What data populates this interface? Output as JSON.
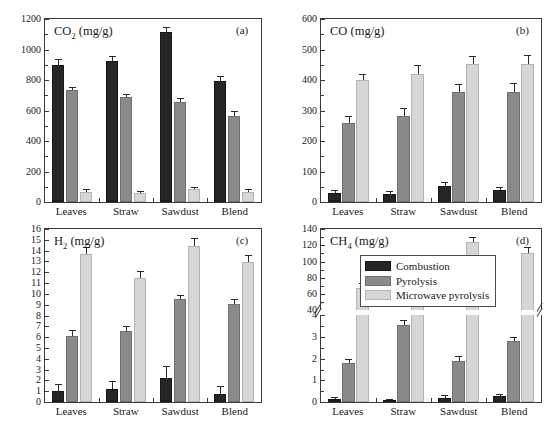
{
  "figure": {
    "categories": [
      "Leaves",
      "Straw",
      "Sawdust",
      "Blend"
    ],
    "legend": {
      "items": [
        {
          "label": "Combustion",
          "color": "#262626",
          "key": "combustion"
        },
        {
          "label": "Pyrolysis",
          "color": "#8a8a8a",
          "key": "pyrolysis"
        },
        {
          "label": "Microwave pyrolysis",
          "color": "#d6d6d6",
          "key": "microwave"
        }
      ]
    }
  },
  "chart_data": [
    {
      "type": "bar",
      "panel": "a",
      "panel_label": "(a)",
      "title": "CO2 (mg/g)",
      "title_base": "CO",
      "title_sub": "2",
      "title_unit": " (mg/g)",
      "xlabel": "",
      "ylabel": "CO2 (mg/g)",
      "categories": [
        "Leaves",
        "Straw",
        "Sawdust",
        "Blend"
      ],
      "ylim": [
        0,
        1200
      ],
      "yticks": [
        0,
        200,
        400,
        600,
        800,
        1000,
        1200
      ],
      "grid": false,
      "legend_position": "none",
      "series": [
        {
          "name": "Combustion",
          "values": [
            900,
            925,
            1112,
            795
          ],
          "errors": [
            14,
            14,
            14,
            12
          ]
        },
        {
          "name": "Pyrolysis",
          "values": [
            732,
            686,
            657,
            563
          ],
          "errors": [
            9,
            8,
            9,
            14
          ]
        },
        {
          "name": "Microwave pyrolysis",
          "values": [
            67,
            56,
            85,
            67
          ],
          "errors": [
            5,
            4,
            5,
            5
          ]
        }
      ]
    },
    {
      "type": "bar",
      "panel": "b",
      "panel_label": "(b)",
      "title": "CO (mg/g)",
      "title_base": "CO",
      "title_sub": "",
      "title_unit": " (mg/g)",
      "xlabel": "",
      "ylabel": "CO (mg/g)",
      "categories": [
        "Leaves",
        "Straw",
        "Sawdust",
        "Blend"
      ],
      "ylim": [
        0,
        600
      ],
      "yticks": [
        0,
        100,
        200,
        300,
        400,
        500,
        600
      ],
      "grid": false,
      "legend_position": "none",
      "series": [
        {
          "name": "Combustion",
          "values": [
            29,
            27,
            53,
            39
          ],
          "errors": [
            3,
            3,
            4,
            3
          ]
        },
        {
          "name": "Pyrolysis",
          "values": [
            258,
            282,
            360,
            361
          ],
          "errors": [
            10,
            12,
            12,
            13
          ]
        },
        {
          "name": "Microwave pyrolysis",
          "values": [
            400,
            419,
            451,
            451
          ],
          "errors": [
            8,
            13,
            13,
            14
          ]
        }
      ]
    },
    {
      "type": "bar",
      "panel": "c",
      "panel_label": "(c)",
      "title": "H2 (mg/g)",
      "title_base": "H",
      "title_sub": "2",
      "title_unit": " (mg/g)",
      "xlabel": "",
      "ylabel": "H2 (mg/g)",
      "categories": [
        "Leaves",
        "Straw",
        "Sawdust",
        "Blend"
      ],
      "ylim": [
        0,
        16
      ],
      "yticks": [
        0,
        1,
        2,
        3,
        4,
        5,
        6,
        7,
        8,
        9,
        10,
        11,
        12,
        13,
        14,
        15,
        16
      ],
      "grid": false,
      "legend_position": "none",
      "series": [
        {
          "name": "Combustion",
          "values": [
            1.02,
            1.24,
            2.2,
            0.76
          ],
          "errors": [
            0.28,
            0.32,
            0.5,
            0.3
          ]
        },
        {
          "name": "Pyrolysis",
          "values": [
            6.15,
            6.55,
            9.55,
            9.02
          ],
          "errors": [
            0.2,
            0.18,
            0.14,
            0.2
          ]
        },
        {
          "name": "Microwave pyrolysis",
          "values": [
            13.65,
            11.5,
            14.45,
            12.92
          ],
          "errors": [
            0.3,
            0.25,
            0.3,
            0.3
          ]
        }
      ]
    },
    {
      "type": "bar",
      "panel": "d",
      "panel_label": "(d)",
      "title": "CH4 (mg/g)",
      "title_base": "CH",
      "title_sub": "4",
      "title_unit": " (mg/g)",
      "xlabel": "",
      "ylabel": "CH4 (mg/g)",
      "categories": [
        "Leaves",
        "Straw",
        "Sawdust",
        "Blend"
      ],
      "broken_axis": true,
      "ylim_lower": [
        0,
        4
      ],
      "yticks_lower": [
        0,
        1,
        2,
        3,
        4
      ],
      "ylim_upper": [
        40,
        140
      ],
      "yticks_upper": [
        40,
        60,
        80,
        100,
        120,
        140
      ],
      "grid": false,
      "legend_position": "upper-center-left",
      "series": [
        {
          "name": "Combustion",
          "values": [
            0.12,
            0.05,
            0.2,
            0.26
          ],
          "errors": [
            0.03,
            0.02,
            0.04,
            0.04
          ]
        },
        {
          "name": "Pyrolysis",
          "values": [
            1.78,
            3.55,
            1.9,
            2.8
          ],
          "errors": [
            0.07,
            0.1,
            0.1,
            0.08
          ]
        },
        {
          "name": "Microwave pyrolysis",
          "values": [
            67,
            48.5,
            123.5,
            111
          ],
          "errors": [
            3,
            2,
            3,
            3
          ]
        }
      ]
    }
  ]
}
